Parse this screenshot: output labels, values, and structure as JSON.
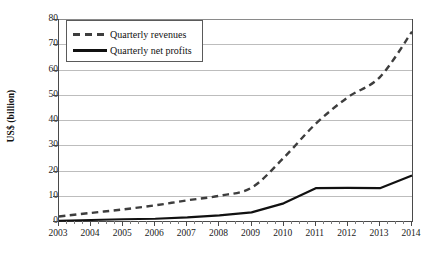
{
  "chart_data": {
    "type": "line",
    "title": "",
    "xlabel": "",
    "ylabel": "US$ (billion)",
    "ylim": [
      0,
      80
    ],
    "yticks": [
      0,
      10,
      20,
      30,
      40,
      50,
      60,
      70,
      80
    ],
    "ytick_labels": [
      "0",
      "10",
      "20",
      "30",
      "40",
      "50",
      "60",
      "70",
      "80"
    ],
    "grid": true,
    "legend_position": "upper left",
    "categories": [
      "2003",
      "2004",
      "2005",
      "2006",
      "2007",
      "2008",
      "2009",
      "2010",
      "2011",
      "2012",
      "2013",
      "2014"
    ],
    "xlim": [
      2003,
      2014
    ],
    "series": [
      {
        "name": "Quarterly revenues",
        "style": "dashed",
        "color": "#3d3d3d",
        "x": [
          2003,
          2004,
          2005,
          2006,
          2007,
          2008,
          2009,
          2010,
          2011,
          2012,
          2013,
          2014
        ],
        "values": [
          1.8,
          3.2,
          4.6,
          6.2,
          8.2,
          10.0,
          13.2,
          25.0,
          38.5,
          49.0,
          57.0,
          75.0
        ]
      },
      {
        "name": "Quarterly net profits",
        "style": "solid",
        "color": "#111111",
        "x": [
          2003,
          2004,
          2005,
          2006,
          2007,
          2008,
          2009,
          2010,
          2011,
          2012,
          2013,
          2014
        ],
        "values": [
          0.1,
          0.4,
          0.7,
          0.9,
          1.4,
          2.2,
          3.4,
          7.0,
          13.0,
          13.1,
          13.0,
          18.0
        ]
      }
    ]
  },
  "legend": {
    "items": [
      {
        "label": "Quarterly revenues",
        "style": "dashed"
      },
      {
        "label": "Quarterly net profits",
        "style": "solid"
      }
    ]
  },
  "axis": {
    "y_title": "US$ (billion)"
  }
}
